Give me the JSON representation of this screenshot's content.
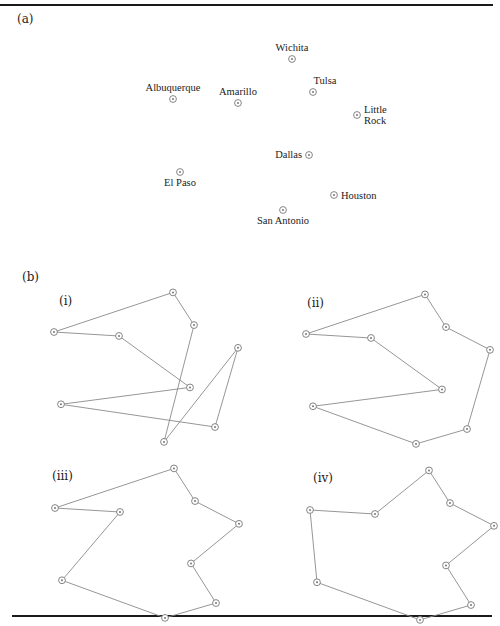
{
  "figure": {
    "panel_a_label": "(a)",
    "panel_b_label": "(b)",
    "subpanels": [
      {
        "id": "i",
        "label": "(i)"
      },
      {
        "id": "ii",
        "label": "(ii)"
      },
      {
        "id": "iii",
        "label": "(iii)"
      },
      {
        "id": "iv",
        "label": "(iv)"
      }
    ]
  },
  "map": {
    "cities": [
      {
        "name": "Wichita",
        "label_lines": [
          "Wichita"
        ],
        "x": 292,
        "y": 59,
        "label_pos": "above"
      },
      {
        "name": "Albuquerque",
        "label_lines": [
          "Albuquerque"
        ],
        "x": 173,
        "y": 99,
        "label_pos": "above"
      },
      {
        "name": "Amarillo",
        "label_lines": [
          "Amarillo"
        ],
        "x": 238,
        "y": 103,
        "label_pos": "above"
      },
      {
        "name": "Tulsa",
        "label_lines": [
          "Tulsa"
        ],
        "x": 313,
        "y": 92,
        "label_pos": "above-right"
      },
      {
        "name": "Little Rock",
        "label_lines": [
          "Little",
          "Rock"
        ],
        "x": 357,
        "y": 115,
        "label_pos": "right"
      },
      {
        "name": "Dallas",
        "label_lines": [
          "Dallas"
        ],
        "x": 309,
        "y": 155,
        "label_pos": "left"
      },
      {
        "name": "El Paso",
        "label_lines": [
          "El Paso"
        ],
        "x": 180,
        "y": 172,
        "label_pos": "below"
      },
      {
        "name": "Houston",
        "label_lines": [
          "Houston"
        ],
        "x": 334,
        "y": 195,
        "label_pos": "right"
      },
      {
        "name": "San Antonio",
        "label_lines": [
          "San Antonio"
        ],
        "x": 283,
        "y": 210,
        "label_pos": "below"
      }
    ]
  },
  "tours": {
    "i": [
      "Albuquerque",
      "Wichita",
      "Tulsa",
      "San Antonio",
      "Little Rock",
      "Houston",
      "El Paso",
      "Dallas",
      "Amarillo",
      "Albuquerque"
    ],
    "ii": [
      "Albuquerque",
      "Wichita",
      "Tulsa",
      "Little Rock",
      "Houston",
      "San Antonio",
      "El Paso",
      "Dallas",
      "Amarillo",
      "Albuquerque"
    ],
    "iii": [
      "Albuquerque",
      "Wichita",
      "Tulsa",
      "Little Rock",
      "Dallas",
      "Houston",
      "San Antonio",
      "El Paso",
      "Amarillo",
      "Albuquerque"
    ],
    "iv": [
      "Albuquerque",
      "El Paso",
      "San Antonio",
      "Houston",
      "Dallas",
      "Little Rock",
      "Tulsa",
      "Wichita",
      "Amarillo",
      "Albuquerque"
    ]
  },
  "colors": {
    "rule": "#1a1a1a",
    "edge": "#8a8a8a",
    "marker": "#777777",
    "text": "#222222"
  }
}
